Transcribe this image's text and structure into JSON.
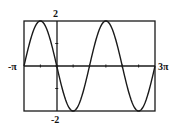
{
  "chart_data": {
    "type": "line",
    "title": "",
    "function": "y = -2 sin(x)",
    "xlabel": "",
    "ylabel": "",
    "xlim": [
      -3.14159265,
      9.42477796
    ],
    "ylim": [
      -2,
      2
    ],
    "x_tick_step": 1.5707963,
    "y_tick_step": 1,
    "x_labels": {
      "left": "-π",
      "right": "3π"
    },
    "y_labels": {
      "top": "2",
      "bottom": "-2"
    },
    "grid": false,
    "legend": null,
    "series": [
      {
        "name": "y = -2 sin(x)",
        "amplitude": 2,
        "coefficient": -2,
        "period": 6.2831853,
        "key_points": [
          {
            "x": "-π",
            "y": 0
          },
          {
            "x": "-π/2",
            "y": 2
          },
          {
            "x": "0",
            "y": 0
          },
          {
            "x": "π/2",
            "y": -2
          },
          {
            "x": "π",
            "y": 0
          },
          {
            "x": "3π/2",
            "y": 2
          },
          {
            "x": "2π",
            "y": 0
          },
          {
            "x": "5π/2",
            "y": -2
          },
          {
            "x": "3π",
            "y": 0
          }
        ]
      }
    ],
    "colors": {
      "curve": "#1a1a1a",
      "frame": "#1a1a1a",
      "background": "#ffffff"
    }
  }
}
